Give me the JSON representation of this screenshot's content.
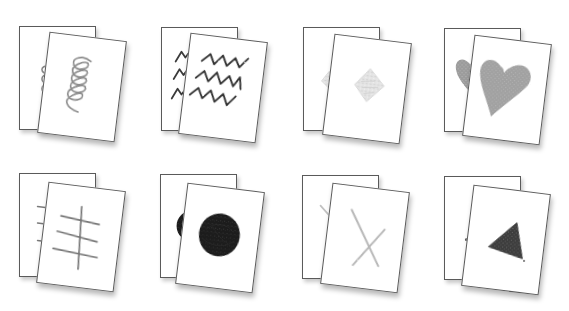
{
  "illustration": {
    "description": "Pairs of cards, each pair showing a hand-drawn symbol in crayon",
    "card_border_color": "#5a5a5a",
    "card_fill_color": "#ffffff",
    "pairs": [
      {
        "row": 1,
        "col": 1,
        "symbol": "spiral",
        "color": "#8a8a8a"
      },
      {
        "row": 1,
        "col": 2,
        "symbol": "zigzag-lines",
        "color": "#3a3a3a"
      },
      {
        "row": 1,
        "col": 3,
        "symbol": "diamond",
        "color": "#d8d8d8"
      },
      {
        "row": 1,
        "col": 4,
        "symbol": "heart",
        "color": "#9a9a9a"
      },
      {
        "row": 2,
        "col": 1,
        "symbol": "ladder-lines",
        "color": "#7a7a7a"
      },
      {
        "row": 2,
        "col": 2,
        "symbol": "filled-circle",
        "color": "#141414"
      },
      {
        "row": 2,
        "col": 3,
        "symbol": "x-cross",
        "color": "#b8b8b8"
      },
      {
        "row": 2,
        "col": 4,
        "symbol": "triangle",
        "color": "#3c3c3c"
      }
    ]
  }
}
